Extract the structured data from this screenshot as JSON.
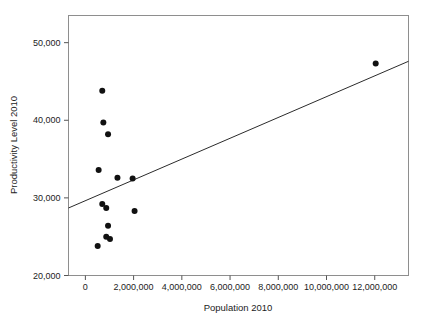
{
  "top_bleed_text": "",
  "chart_data": {
    "type": "scatter",
    "title": "",
    "xlabel": "Population 2010",
    "ylabel": "Productivity Level 2010",
    "xlim": [
      -700000,
      13400000
    ],
    "ylim": [
      20000,
      53500
    ],
    "grid": false,
    "legend": "none",
    "xticks": [
      0,
      2000000,
      4000000,
      6000000,
      8000000,
      10000000,
      12000000
    ],
    "xticklabels": [
      "0",
      "2,000,000",
      "4,000,000",
      "6,000,000",
      "8,000,000",
      "10,000,000",
      "12,000,000"
    ],
    "yticks": [
      20000,
      30000,
      40000,
      50000
    ],
    "yticklabels": [
      "20,000",
      "30,000",
      "40,000",
      "50,000"
    ],
    "points": [
      {
        "x": 700000,
        "y": 43800
      },
      {
        "x": 745000,
        "y": 39700
      },
      {
        "x": 940000,
        "y": 38200
      },
      {
        "x": 550000,
        "y": 33600
      },
      {
        "x": 1330000,
        "y": 32600
      },
      {
        "x": 1960000,
        "y": 32500
      },
      {
        "x": 700000,
        "y": 29200
      },
      {
        "x": 865000,
        "y": 28700
      },
      {
        "x": 2040000,
        "y": 28300
      },
      {
        "x": 940000,
        "y": 26400
      },
      {
        "x": 865000,
        "y": 25000
      },
      {
        "x": 1020000,
        "y": 24700
      },
      {
        "x": 510000,
        "y": 23800
      },
      {
        "x": 12040000,
        "y": 47300
      }
    ],
    "fit_line": {
      "type": "linear",
      "x_start": -700000,
      "y_start": 28700,
      "x_end": 13400000,
      "y_end": 47600
    },
    "marker": {
      "shape": "circle",
      "size_px": 4.2,
      "color": "#111111"
    },
    "line_color": "#2b2b2b",
    "frame_color": "#8e8e8e",
    "background": "#ffffff"
  }
}
